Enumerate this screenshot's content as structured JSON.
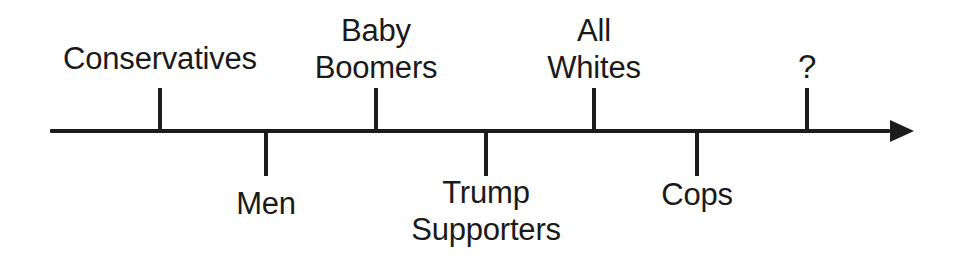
{
  "diagram": {
    "type": "spectrum-number-line",
    "title": "",
    "colors": {
      "ink": "#1c1c1c",
      "text": "#1a1a1a",
      "background": "#ffffff"
    },
    "axis": {
      "name": "horizontal-arrow-axis",
      "x_start": 50,
      "x_end": 890,
      "arrow_tip_x": 914,
      "y": 131,
      "thickness": 4,
      "direction": "right"
    },
    "markers": [
      {
        "id": "conservatives",
        "label": "Conservatives",
        "x": 160,
        "side": "above",
        "label_x": 160,
        "label_y": 40,
        "lines": 1,
        "tick_top": 88,
        "tick_bottom": 133
      },
      {
        "id": "men",
        "label": "Men",
        "x": 266,
        "side": "below",
        "label_x": 266,
        "label_y": 185,
        "lines": 1,
        "tick_top": 131,
        "tick_bottom": 176
      },
      {
        "id": "baby-boomers",
        "label": "Baby\nBoomers",
        "x": 376,
        "side": "above",
        "label_x": 376,
        "label_y": 12,
        "lines": 2,
        "tick_top": 88,
        "tick_bottom": 133
      },
      {
        "id": "trump-supporters",
        "label": "Trump\nSupporters",
        "x": 486,
        "side": "below",
        "label_x": 486,
        "label_y": 174,
        "lines": 2,
        "tick_top": 131,
        "tick_bottom": 176
      },
      {
        "id": "all-whites",
        "label": "All\nWhites",
        "x": 594,
        "side": "above",
        "label_x": 594,
        "label_y": 12,
        "lines": 2,
        "tick_top": 88,
        "tick_bottom": 133
      },
      {
        "id": "cops",
        "label": "Cops",
        "x": 697,
        "side": "below",
        "label_x": 697,
        "label_y": 176,
        "lines": 1,
        "tick_top": 131,
        "tick_bottom": 176
      },
      {
        "id": "question-mark",
        "label": "?",
        "x": 807,
        "side": "above",
        "label_x": 807,
        "label_y": 48,
        "lines": 1,
        "tick_top": 88,
        "tick_bottom": 133
      }
    ]
  }
}
